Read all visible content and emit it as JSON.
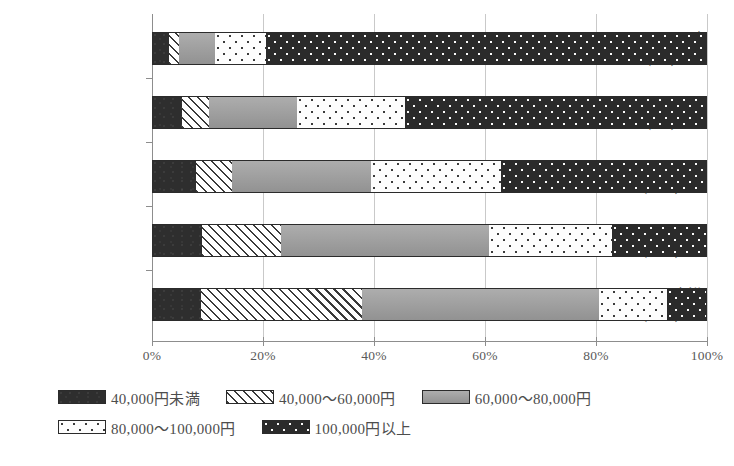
{
  "chart_data": {
    "type": "bar",
    "orientation": "horizontal",
    "stacked": true,
    "percent": true,
    "title": "",
    "xlabel": "",
    "ylabel": "",
    "xlim": [
      0,
      100
    ],
    "xticks": [
      "0%",
      "20%",
      "40%",
      "60%",
      "80%",
      "100%"
    ],
    "xtick_values": [
      0,
      20,
      40,
      60,
      80,
      100
    ],
    "grid": "vertical",
    "legend_position": "bottom",
    "categories": [
      "1000万円以上",
      "700～1000",
      "500～700",
      "300～500",
      "300万円未満"
    ],
    "category_sublabels": [
      "(1.3)",
      "(4.4)",
      "(10.5)",
      "(28.9)",
      "(35.7)"
    ],
    "series": [
      {
        "name": "40,000円未満",
        "pattern": "solid-dark",
        "values": [
          3.1,
          5.4,
          7.9,
          9.0,
          8.8
        ]
      },
      {
        "name": "40,000～60,000円",
        "pattern": "hatch",
        "values": [
          1.8,
          4.9,
          6.5,
          14.3,
          29.1
        ]
      },
      {
        "name": "60,000～80,000円",
        "pattern": "gray",
        "values": [
          6.5,
          15.9,
          25.1,
          37.5,
          42.6
        ]
      },
      {
        "name": "80,000～100,000円",
        "pattern": "dots-light",
        "values": [
          9.2,
          19.3,
          23.3,
          22.1,
          12.3
        ]
      },
      {
        "name": "100,000円以上",
        "pattern": "dots-dark",
        "values": [
          79.4,
          54.5,
          37.2,
          17.1,
          7.2
        ]
      }
    ],
    "cumulative_boundaries": [
      [
        3.1,
        4.9,
        11.4,
        20.6,
        100
      ],
      [
        5.4,
        10.3,
        26.2,
        45.5,
        100
      ],
      [
        7.9,
        14.4,
        39.5,
        62.8,
        100
      ],
      [
        9.0,
        23.3,
        60.8,
        82.9,
        100
      ],
      [
        8.8,
        37.9,
        80.5,
        92.8,
        100
      ]
    ]
  },
  "legend": {
    "items": [
      {
        "label": "40,000円未満",
        "pattern": "solid-dark"
      },
      {
        "label": "40,000～60,000円",
        "pattern": "hatch"
      },
      {
        "label": "60,000～80,000円",
        "pattern": "gray"
      },
      {
        "label": "80,000～100,000円",
        "pattern": "dots-light"
      },
      {
        "label": "100,000円以上",
        "pattern": "dots-dark"
      }
    ]
  },
  "colors": {
    "axis": "#8d8d8d",
    "grid": "#c9c9c9",
    "text": "#4d4d4d",
    "dark": "#2e2e2e",
    "gray": "#9b9b9b",
    "light": "#fdfdfd"
  }
}
